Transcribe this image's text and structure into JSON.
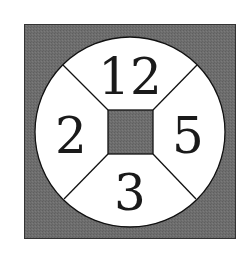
{
  "diagram": {
    "type": "circular-sector-puzzle",
    "colors": {
      "background": "#ffffff",
      "outer_square_fill": "#6e6e6e",
      "circle_fill": "#ffffff",
      "center_square_fill": "#6e6e6e",
      "stroke": "#111111",
      "text": "#1a1a1a"
    },
    "sectors": {
      "top": {
        "label": "12"
      },
      "left": {
        "label": "2"
      },
      "right": {
        "label": "5"
      },
      "bottom": {
        "label": "3"
      }
    }
  }
}
